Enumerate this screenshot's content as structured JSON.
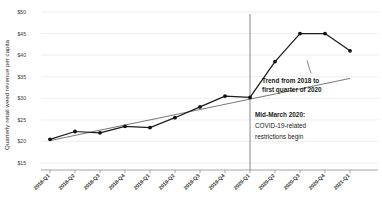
{
  "chart_data": {
    "type": "line",
    "title": "",
    "xlabel": "",
    "ylabel": "Quarterly retail weed revenue per capita",
    "ylim": [
      15,
      50
    ],
    "yticks": [
      15,
      20,
      25,
      30,
      35,
      40,
      45,
      50
    ],
    "ytick_labels": [
      "$15",
      "$20",
      "$25",
      "$30",
      "$35",
      "$40",
      "$45",
      "$50"
    ],
    "grid": true,
    "legend": "none",
    "categories": [
      "2018-Q1",
      "2018-Q2",
      "2018-Q3",
      "2018-Q4",
      "2019-Q1",
      "2019-Q2",
      "2019-Q3",
      "2019-Q4",
      "2020-Q1",
      "2020-Q2",
      "2020-Q3",
      "2020-Q4",
      "2021-Q1"
    ],
    "series": [
      {
        "name": "Quarterly retail weed revenue per capita",
        "values": [
          20.5,
          22.3,
          22.0,
          23.5,
          23.2,
          25.5,
          28.0,
          30.5,
          30.2,
          38.5,
          45.0,
          45.0,
          41.0
        ]
      },
      {
        "name": "Trend from 2018 to first quarter of 2020",
        "values": [
          20.2,
          21.4,
          22.6,
          23.8,
          25.0,
          26.2,
          27.4,
          28.6,
          29.8,
          31.0,
          32.2,
          33.4,
          34.6
        ]
      }
    ],
    "annotations": [
      {
        "name": "trend-annotation",
        "line1": "Trend from 2018 to",
        "line2": "first quarter of 2020"
      },
      {
        "name": "covid-annotation",
        "line1": "Mid-March 2020:",
        "line2": "COVID-19-related",
        "line3": "restrictions begin"
      }
    ],
    "event_marker": {
      "name": "mid-march-2020-line",
      "category": "2020-Q1"
    },
    "colors": {
      "data_line": "#1d1d1d",
      "trend_line": "#4a4a4a",
      "grid": "#e2e2e2",
      "axis": "#8d8d8d",
      "event_line": "#7a7a7a",
      "text": "#1a1a1a",
      "background": "#ffffff"
    }
  }
}
